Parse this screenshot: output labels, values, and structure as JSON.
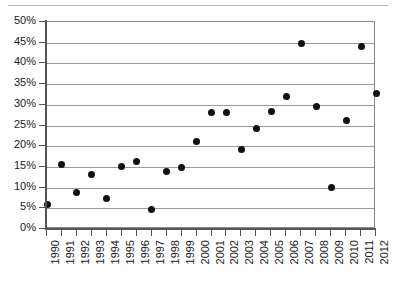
{
  "chart_data": {
    "type": "scatter",
    "title": "",
    "subtitle": "",
    "xlabel": "",
    "ylabel": "",
    "xlim": [
      1990,
      2012
    ],
    "ylim": [
      0,
      50
    ],
    "grid": true,
    "legend": false,
    "legend_position": "none",
    "y_tick_labels": [
      "0%",
      "5%",
      "10%",
      "15%",
      "20%",
      "25%",
      "30%",
      "35%",
      "40%",
      "45%",
      "50%"
    ],
    "y_tick_values": [
      0,
      5,
      10,
      15,
      20,
      25,
      30,
      35,
      40,
      45,
      50
    ],
    "y_unit": "%",
    "categories": [
      "1990",
      "1991",
      "1992",
      "1993",
      "1994",
      "1995",
      "1996",
      "1997",
      "1998",
      "1999",
      "2000",
      "2001",
      "2002",
      "2003",
      "2004",
      "2005",
      "2006",
      "2007",
      "2008",
      "2009",
      "2010",
      "2011",
      "2012"
    ],
    "x": [
      1990,
      1991,
      1992,
      1993,
      1994,
      1995,
      1996,
      1997,
      1998,
      1999,
      2000,
      2001,
      2002,
      2003,
      2004,
      2005,
      2006,
      2007,
      2008,
      2009,
      2010,
      2011,
      2012
    ],
    "values": [
      6.0,
      15.5,
      8.9,
      13.1,
      7.4,
      15.1,
      16.3,
      4.7,
      14.0,
      14.8,
      21.1,
      28.2,
      28.2,
      19.1,
      24.3,
      28.3,
      32.1,
      44.7,
      29.7,
      10.0,
      26.2,
      44.2,
      32.8
    ],
    "marker": "filled-circle",
    "marker_color": "#111111",
    "grid_color": "#9a9a9a",
    "axis_color": "#555555",
    "background": "#ffffff"
  }
}
